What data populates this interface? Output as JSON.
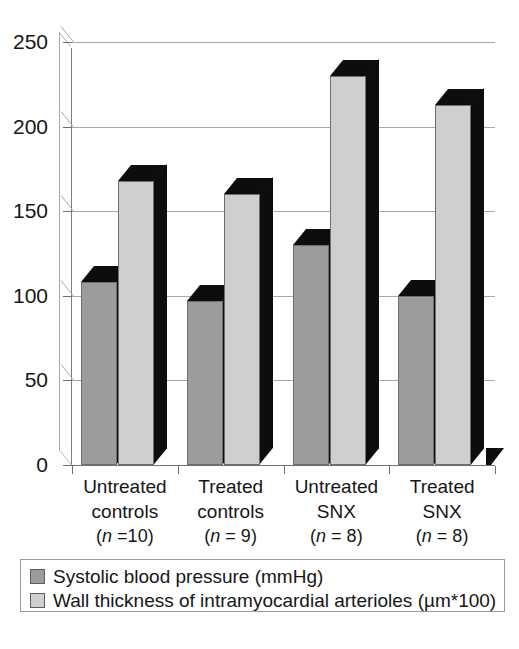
{
  "chart_data": {
    "type": "bar",
    "title": "",
    "subtitle": "",
    "xlabel": "",
    "ylabel": "",
    "ylim": [
      0,
      250
    ],
    "yticks": [
      0,
      50,
      100,
      150,
      200,
      250
    ],
    "ytick_labels": [
      "0",
      "50",
      "100",
      "150",
      "200",
      "250"
    ],
    "grid": true,
    "grid_axis": "y",
    "legend_position": "bottom",
    "style": "3d-column",
    "categories": [
      "Untreated controls",
      "Treated controls",
      "Untreated SNX",
      "Treated SNX"
    ],
    "category_lines": [
      {
        "line1": "Untreated",
        "line2": "controls",
        "n_prefix": "(",
        "n_italic": "n",
        "n_suffix": " =10)"
      },
      {
        "line1": "Treated",
        "line2": "controls",
        "n_prefix": "(",
        "n_italic": "n",
        "n_suffix": " = 9)"
      },
      {
        "line1": "Untreated",
        "line2": "SNX",
        "n_prefix": "(",
        "n_italic": "n",
        "n_suffix": " = 8)"
      },
      {
        "line1": "Treated",
        "line2": "SNX",
        "n_prefix": "(",
        "n_italic": "n",
        "n_suffix": " = 8)"
      }
    ],
    "sample_sizes": [
      10,
      9,
      8,
      8
    ],
    "series": [
      {
        "name": "Systolic blood pressure (mmHg)",
        "color": "#9c9c9c",
        "values": [
          108,
          97,
          130,
          100
        ]
      },
      {
        "name": "Wall thickness of intramyocardial arterioles (µm*100)",
        "color": "#cfcfcf",
        "values": [
          168,
          160,
          230,
          213
        ]
      }
    ]
  },
  "legend": {
    "items": [
      {
        "label": "Systolic blood pressure (mmHg)",
        "color": "#9c9c9c"
      },
      {
        "label": "Wall thickness of intramyocardial arterioles (µm*100)",
        "color": "#cfcfcf"
      }
    ]
  },
  "colors": {
    "series_1": "#9c9c9c",
    "series_2": "#cfcfcf",
    "bar_side": "#0d0d0d",
    "gridline": "#a8a8a8",
    "axis": "#6f6f6f",
    "text": "#161616",
    "background": "#ffffff"
  }
}
